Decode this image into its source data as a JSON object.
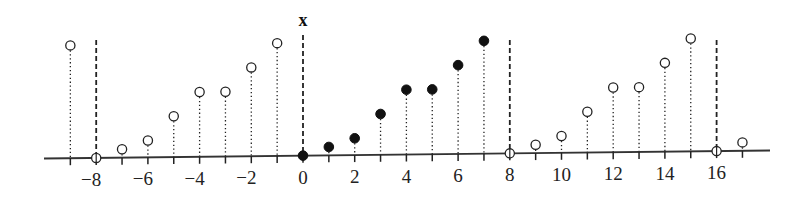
{
  "chart_data": {
    "type": "stem",
    "title": "x",
    "xlabel": "",
    "ylabel": "",
    "period": 8,
    "x_range": [
      -9,
      17
    ],
    "tick_labels": [
      -8,
      -6,
      -4,
      -2,
      0,
      2,
      4,
      6,
      8,
      10,
      12,
      14,
      16
    ],
    "period_markers": [
      -8,
      0,
      8,
      16
    ],
    "one_period": {
      "n": [
        0,
        1,
        2,
        3,
        4,
        5,
        6,
        7
      ],
      "values": [
        0,
        0.35,
        0.7,
        1.7,
        2.7,
        2.7,
        3.7,
        4.7
      ]
    },
    "points": [
      {
        "n": -9,
        "value": 4.7,
        "filled": false
      },
      {
        "n": -8,
        "value": 0,
        "filled": false
      },
      {
        "n": -7,
        "value": 0.35,
        "filled": false
      },
      {
        "n": -6,
        "value": 0.7,
        "filled": false
      },
      {
        "n": -5,
        "value": 1.7,
        "filled": false
      },
      {
        "n": -4,
        "value": 2.7,
        "filled": false
      },
      {
        "n": -3,
        "value": 2.7,
        "filled": false
      },
      {
        "n": -2,
        "value": 3.7,
        "filled": false
      },
      {
        "n": -1,
        "value": 4.7,
        "filled": false
      },
      {
        "n": 0,
        "value": 0,
        "filled": true
      },
      {
        "n": 1,
        "value": 0.35,
        "filled": true
      },
      {
        "n": 2,
        "value": 0.7,
        "filled": true
      },
      {
        "n": 3,
        "value": 1.7,
        "filled": true
      },
      {
        "n": 4,
        "value": 2.7,
        "filled": true
      },
      {
        "n": 5,
        "value": 2.7,
        "filled": true
      },
      {
        "n": 6,
        "value": 3.7,
        "filled": true
      },
      {
        "n": 7,
        "value": 4.7,
        "filled": true
      },
      {
        "n": 8,
        "value": 0,
        "filled": false
      },
      {
        "n": 9,
        "value": 0.35,
        "filled": false
      },
      {
        "n": 10,
        "value": 0.7,
        "filled": false
      },
      {
        "n": 11,
        "value": 1.7,
        "filled": false
      },
      {
        "n": 12,
        "value": 2.7,
        "filled": false
      },
      {
        "n": 13,
        "value": 2.7,
        "filled": false
      },
      {
        "n": 14,
        "value": 3.7,
        "filled": false
      },
      {
        "n": 15,
        "value": 4.7,
        "filled": false
      },
      {
        "n": 16,
        "value": 0,
        "filled": false
      },
      {
        "n": 17,
        "value": 0.35,
        "filled": false
      }
    ],
    "grid": false,
    "legend": null
  },
  "layout": {
    "x0_px": 303,
    "px_per_unit_x": 25.85,
    "px_per_unit_y": 24,
    "axis_left_px": 44,
    "axis_right_px": 770,
    "axis_y_left": 158.5,
    "axis_y_right": 150.5,
    "marker_top_offset": 116
  },
  "colors": {
    "ink": "#222222",
    "background": "#ffffff"
  }
}
